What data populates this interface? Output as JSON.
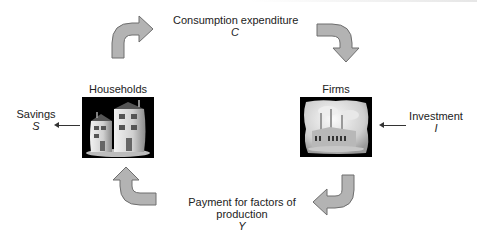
{
  "diagram": {
    "type": "circular-flow",
    "nodes": {
      "households": {
        "label": "Households",
        "icon": "houses-icon"
      },
      "firms": {
        "label": "Firms",
        "icon": "factory-icon"
      }
    },
    "flows": {
      "consumption": {
        "label": "Consumption expenditure",
        "symbol": "C",
        "from": "households",
        "to": "firms"
      },
      "payment": {
        "label_line1": "Payment for factors of",
        "label_line2": "production",
        "symbol": "Y",
        "from": "firms",
        "to": "households"
      },
      "savings": {
        "label": "Savings",
        "symbol": "S",
        "direction": "out-of-households"
      },
      "investment": {
        "label": "Investment",
        "symbol": "I",
        "direction": "into-firms"
      }
    },
    "colors": {
      "arrow_fill": "#b3b3b3",
      "arrow_stroke": "#6e6e6e",
      "text": "#222222",
      "image_bg": "#000000"
    }
  }
}
